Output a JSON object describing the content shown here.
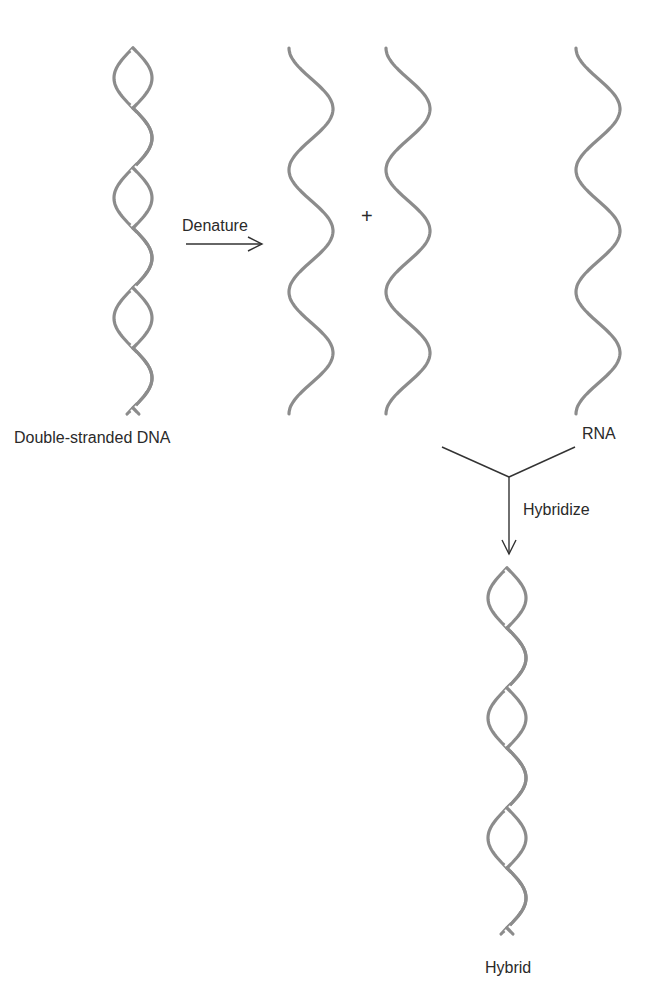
{
  "diagram": {
    "type": "process-flow",
    "style": {
      "strand_color": "#8c8c8c",
      "arrow_color": "#333333",
      "text_color": "#2a2a2a",
      "background": "#ffffff"
    }
  },
  "labels": {
    "double_stranded_dna": "Double-stranded DNA",
    "denature": "Denature",
    "plus": "+",
    "rna": "RNA",
    "hybridize": "Hybridize",
    "hybrid": "Hybrid"
  },
  "elements": {
    "dsdna_helix": {
      "cx": 133,
      "top": 48,
      "bottom": 415,
      "amplitude": 19,
      "period": 120
    },
    "ssdna_strand_1": {
      "cx": 311,
      "top": 48,
      "bottom": 415,
      "amplitude": 22,
      "period": 122
    },
    "ssdna_strand_2": {
      "cx": 408,
      "top": 48,
      "bottom": 415,
      "amplitude": 22,
      "period": 122
    },
    "rna_strand": {
      "cx": 598,
      "top": 48,
      "bottom": 415,
      "amplitude": 22,
      "period": 122
    },
    "hybrid_helix": {
      "cx": 507,
      "top": 568,
      "bottom": 935,
      "amplitude": 19,
      "period": 120
    }
  }
}
